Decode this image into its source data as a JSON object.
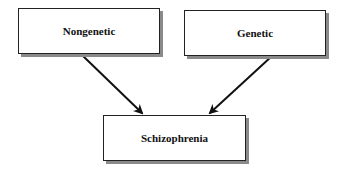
{
  "diagram": {
    "type": "causal-flow",
    "nodes": [
      {
        "id": "nongenetic",
        "label": "Nongenetic"
      },
      {
        "id": "genetic",
        "label": "Genetic"
      },
      {
        "id": "schizophrenia",
        "label": "Schizophrenia"
      }
    ],
    "edges": [
      {
        "from": "nongenetic",
        "to": "schizophrenia"
      },
      {
        "from": "genetic",
        "to": "schizophrenia"
      }
    ],
    "colors": {
      "line": "#111111",
      "shadow": "#8a8a8a",
      "box": "#ffffff"
    }
  }
}
